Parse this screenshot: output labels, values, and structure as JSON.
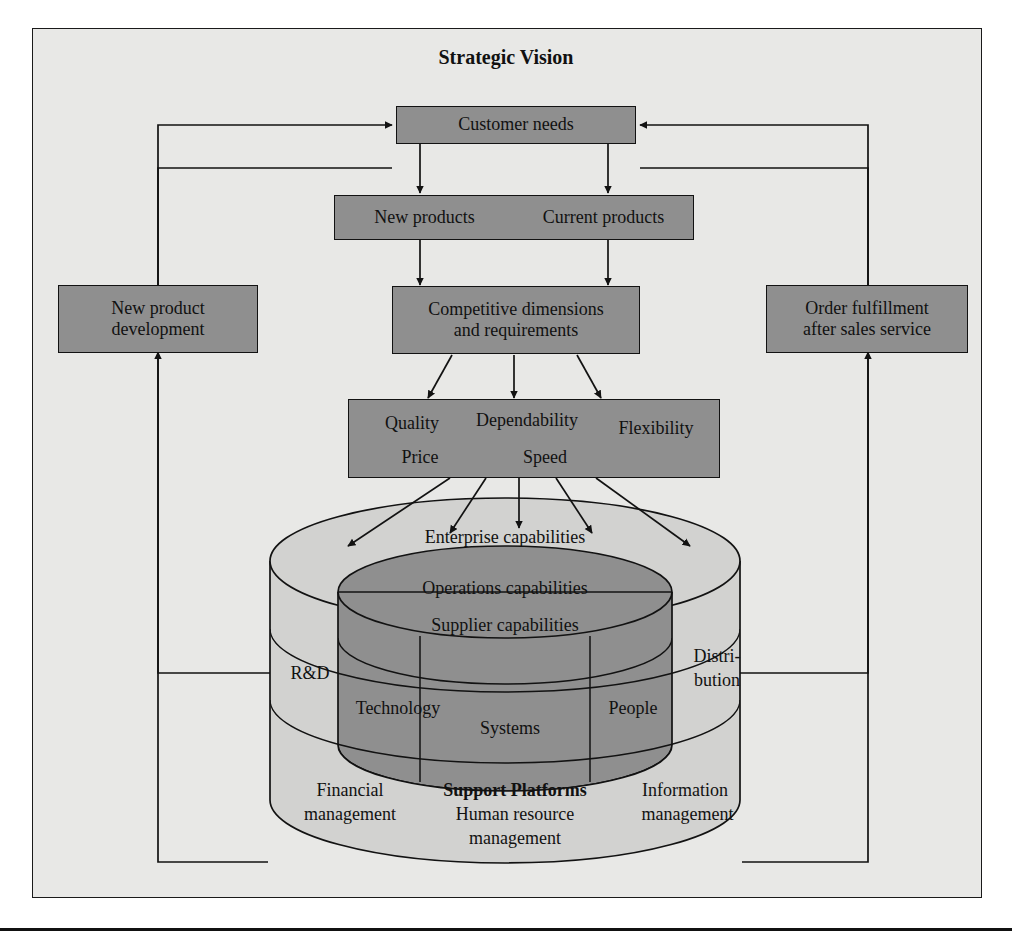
{
  "title": "Strategic Vision",
  "boxes": {
    "customer_needs": "Customer needs",
    "new_products": "New products",
    "current_products": "Current products",
    "new_product_development_l1": "New product",
    "new_product_development_l2": "development",
    "order_fulfillment_l1": "Order fulfillment",
    "order_fulfillment_l2": "after sales service",
    "competitive_l1": "Competitive dimensions",
    "competitive_l2": "and requirements"
  },
  "dimensions": {
    "quality": "Quality",
    "dependability": "Dependability",
    "flexibility": "Flexibility",
    "price": "Price",
    "speed": "Speed"
  },
  "cylinder": {
    "enterprise": "Enterprise capabilities",
    "operations": "Operations capabilities",
    "supplier": "Supplier capabilities",
    "rd": "R&D",
    "distribution_l1": "Distri-",
    "distribution_l2": "bution",
    "technology": "Technology",
    "systems": "Systems",
    "people": "People",
    "financial_l1": "Financial",
    "financial_l2": "management",
    "support_platforms": "Support Platforms",
    "hr_l1": "Human resource",
    "hr_l2": "management",
    "information_l1": "Information",
    "information_l2": "management"
  },
  "colors": {
    "frame_bg": "#e8e8e6",
    "box_fill": "#8f8f8f",
    "outer_disc": "#d2d2d0",
    "inner_disc": "#8f8f8f",
    "stroke": "#121212"
  }
}
